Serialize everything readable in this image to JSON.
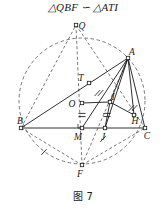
{
  "heading": {
    "text": "△QBF ∽ △ATI"
  },
  "caption": {
    "text": "图 7"
  },
  "figure": {
    "name": "circle-geometry-diagram",
    "colors": {
      "stroke": "#1a1a1a",
      "dashed": "#555555",
      "background": "#ffffff"
    },
    "circle": {
      "cx": 82,
      "cy": 87,
      "r": 63,
      "style": "dashed"
    },
    "points": [
      {
        "id": "Q",
        "label": "Q",
        "x": 76,
        "y": 11,
        "label_dx": 6,
        "label_dy": 4,
        "marker": "square"
      },
      {
        "id": "A",
        "label": "A",
        "x": 128,
        "y": 44,
        "label_dx": 4,
        "label_dy": -3,
        "marker": "square"
      },
      {
        "id": "T",
        "label": "T",
        "x": 89,
        "y": 69,
        "label_dx": -8,
        "label_dy": -2,
        "marker": "square"
      },
      {
        "id": "I",
        "label": "I",
        "x": 110,
        "y": 88,
        "label_dx": 3,
        "label_dy": -2,
        "marker": "square"
      },
      {
        "id": "O",
        "label": "O",
        "x": 82,
        "y": 89,
        "label_dx": -10,
        "label_dy": 4,
        "marker": "square"
      },
      {
        "id": "B",
        "label": "B",
        "x": 21,
        "y": 114,
        "label_dx": -1,
        "label_dy": -4,
        "marker": "square"
      },
      {
        "id": "M",
        "label": "M",
        "x": 82,
        "y": 114,
        "label_dx": -4,
        "label_dy": 12,
        "marker": "square"
      },
      {
        "id": "J",
        "label": "J",
        "x": 105,
        "y": 114,
        "label_dx": -2,
        "label_dy": 12,
        "marker": "square"
      },
      {
        "id": "H",
        "label": "H",
        "x": 134,
        "y": 101,
        "label_dx": 1,
        "label_dy": 9,
        "marker": "square"
      },
      {
        "id": "C",
        "label": "C",
        "x": 145,
        "y": 114,
        "label_dx": 2,
        "label_dy": 11,
        "marker": "square"
      },
      {
        "id": "F",
        "label": "F",
        "x": 82,
        "y": 151,
        "label_dx": -2,
        "label_dy": 12,
        "marker": "square"
      }
    ],
    "solid_segments": [
      {
        "name": "segment-BC",
        "from": "B",
        "to": "C"
      },
      {
        "name": "segment-BA",
        "from": "B",
        "to": "A"
      },
      {
        "name": "segment-AC",
        "from": "A",
        "to": "C"
      },
      {
        "name": "segment-AM",
        "from": "A",
        "to": "M"
      },
      {
        "name": "segment-AJ",
        "from": "A",
        "to": "J"
      },
      {
        "name": "segment-AI",
        "from": "A",
        "to": "I"
      },
      {
        "name": "segment-AH",
        "from": "A",
        "to": "H"
      },
      {
        "name": "segment-OI",
        "from": "O",
        "to": "I"
      },
      {
        "name": "segment-IH",
        "from": "I",
        "to": "H"
      },
      {
        "name": "segment-IJ",
        "from": "I",
        "to": "J"
      }
    ],
    "dashed_segments": [
      {
        "name": "segment-QF",
        "from": "Q",
        "to": "F"
      },
      {
        "name": "segment-QC",
        "from": "Q",
        "to": "C"
      },
      {
        "name": "segment-BF",
        "from": "B",
        "to": "F"
      },
      {
        "name": "segment-FC",
        "from": "F",
        "to": "C"
      },
      {
        "name": "segment-FA",
        "from": "F",
        "to": "A"
      },
      {
        "name": "segment-BQ",
        "from": "B",
        "to": "Q"
      }
    ],
    "tick_marks": [
      {
        "name": "tick-OM-double",
        "x": 82,
        "y": 101,
        "count": 2,
        "orientation": "horizontal"
      },
      {
        "name": "tick-IJ-double",
        "x": 107,
        "y": 101,
        "count": 2,
        "orientation": "horizontal"
      },
      {
        "name": "tick-TI-double",
        "x": 99,
        "y": 79,
        "count": 2,
        "orientation": "slanted"
      },
      {
        "name": "tick-AH-double",
        "x": 133,
        "y": 94,
        "count": 2,
        "orientation": "slanted"
      },
      {
        "name": "tick-arc-BF",
        "x": 44,
        "y": 138,
        "count": 1,
        "orientation": "slanted"
      },
      {
        "name": "tick-arc-FC",
        "x": 103,
        "y": 125,
        "count": 1,
        "orientation": "slanted"
      }
    ],
    "right_angle_marks": [
      {
        "name": "right-angle-at-M",
        "x": 82,
        "y": 114
      }
    ]
  }
}
